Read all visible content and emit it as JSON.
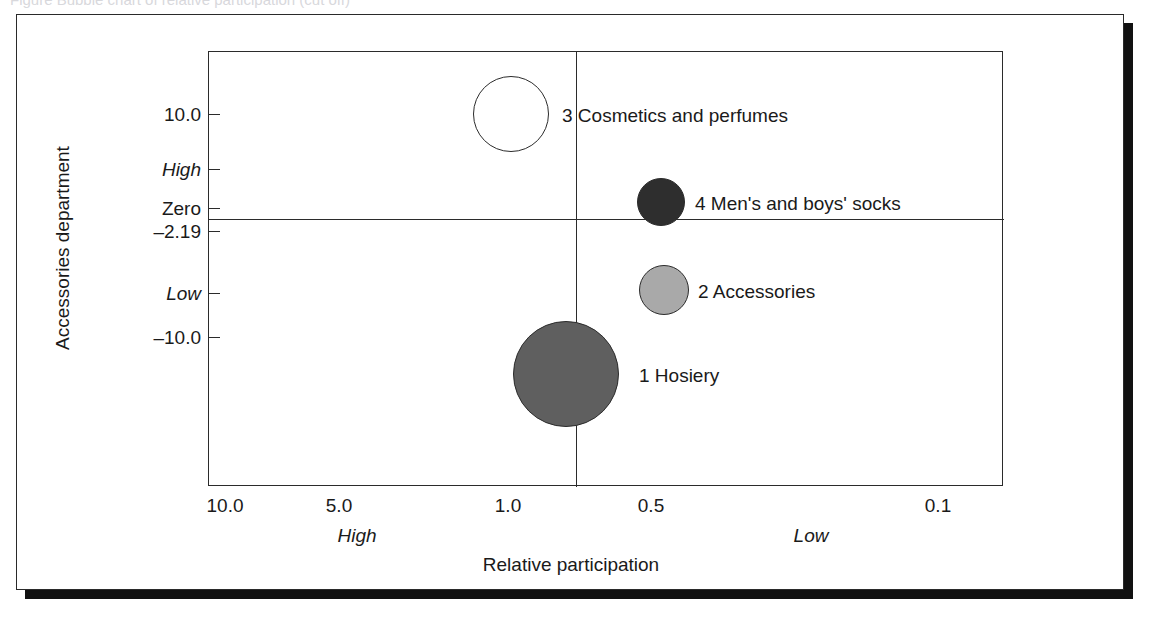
{
  "page": {
    "caption_remnant": "Figure  Bubble chart of relative participation (cut off)"
  },
  "chart_data": {
    "type": "scatter",
    "title": "",
    "xlabel": "Relative participation",
    "ylabel": "Accessories department",
    "x_tick_labels": [
      "10.0",
      "5.0",
      "1.0",
      "0.5",
      "0.1"
    ],
    "x_sub_labels": [
      "High",
      "Low"
    ],
    "y_tick_labels": [
      "10.0",
      "High",
      "Zero",
      "–2.19",
      "Low",
      "–10.0"
    ],
    "xlim": [
      10.0,
      0.1
    ],
    "ylim": [
      10.0,
      -10.0
    ],
    "grid": false,
    "legend": "inline-labels",
    "points": [
      {
        "id": "1",
        "label": "1 Hosiery",
        "x": 0.78,
        "y": -7.0,
        "size": 106,
        "color": "#5f5f5f"
      },
      {
        "id": "2",
        "label": "2 Accessories",
        "x": 0.46,
        "y": -4.2,
        "size": 50,
        "color": "#a9a9a9"
      },
      {
        "id": "3",
        "label": "3 Cosmetics and perfumes",
        "x": 1.02,
        "y": 10.0,
        "size": 76,
        "color": "#ffffff"
      },
      {
        "id": "4",
        "label": "4 Men's and boys' socks",
        "x": 0.46,
        "y": 0.5,
        "size": 48,
        "color": "#2e2e2e"
      }
    ],
    "annotations": [
      "Zero line drawn at –2.19 on the vertical axis",
      "Vertical divider drawn near relative participation 0.78"
    ]
  },
  "axes": {
    "y_title": "Accessories department",
    "x_title": "Relative participation",
    "y_ticks": [
      {
        "label": "10.0",
        "italic": false,
        "top": 63
      },
      {
        "label": "High",
        "italic": true,
        "top": 118
      },
      {
        "label": "Zero",
        "italic": false,
        "top": 157
      },
      {
        "label": "–2.19",
        "italic": false,
        "top": 180
      },
      {
        "label": "Low",
        "italic": true,
        "top": 242
      },
      {
        "label": "–10.0",
        "italic": false,
        "top": 286
      }
    ],
    "x_ticks": [
      {
        "label": "10.0",
        "left": 208
      },
      {
        "label": "5.0",
        "left": 322
      },
      {
        "label": "1.0",
        "left": 491
      },
      {
        "label": "0.5",
        "left": 634
      },
      {
        "label": "0.1",
        "left": 921
      }
    ],
    "x_sub": [
      {
        "label": "High",
        "left": 340
      },
      {
        "label": "Low",
        "left": 794
      }
    ]
  },
  "bubbles": [
    {
      "name": "bubble-cosmetics-and-perfumes",
      "label": "3 Cosmetics and perfumes",
      "cx": 494,
      "cy": 99,
      "r": 38,
      "fill": "#ffffff",
      "label_left": 545,
      "label_top": 91
    },
    {
      "name": "bubble-mens-and-boys-socks",
      "label": "4 Men's and boys' socks",
      "cx": 644,
      "cy": 187,
      "r": 24,
      "fill": "#2e2e2e",
      "label_left": 678,
      "label_top": 179
    },
    {
      "name": "bubble-accessories",
      "label": "2 Accessories",
      "cx": 647,
      "cy": 275,
      "r": 25,
      "fill": "#a9a9a9",
      "label_left": 681,
      "label_top": 267
    },
    {
      "name": "bubble-hosiery",
      "label": "1 Hosiery",
      "cx": 549,
      "cy": 359,
      "r": 53,
      "fill": "#5f5f5f",
      "label_left": 622,
      "label_top": 351
    }
  ]
}
